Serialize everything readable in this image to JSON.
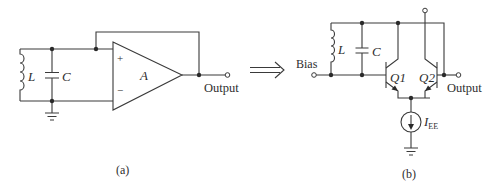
{
  "figure_a": {
    "caption": "(a)",
    "inductor_label": "L",
    "capacitor_label": "C",
    "amplifier_label": "A",
    "plus_label": "+",
    "minus_label": "−",
    "output_label": "Output"
  },
  "arrow": "⟹",
  "figure_b": {
    "caption": "(b)",
    "bias_label": "Bias",
    "inductor_label": "L",
    "capacitor_label": "C",
    "q1_label": "Q1",
    "q2_label": "Q2",
    "output_label": "Output",
    "current_source_label": "I",
    "current_source_subscript": "EE"
  }
}
